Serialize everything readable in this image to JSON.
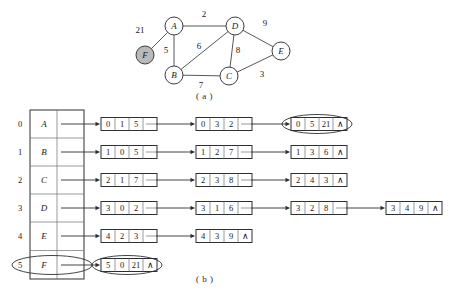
{
  "figure": {
    "caption_a": "( a )",
    "caption_b": "( b )"
  },
  "graph": {
    "nodes": [
      {
        "id": "A",
        "label": "A",
        "x": 174,
        "y": 26,
        "r": 9,
        "highlighted": false
      },
      {
        "id": "D",
        "label": "D",
        "x": 235,
        "y": 26,
        "r": 9,
        "highlighted": false
      },
      {
        "id": "B",
        "label": "B",
        "x": 174,
        "y": 75,
        "r": 9,
        "highlighted": false
      },
      {
        "id": "C",
        "label": "C",
        "x": 229,
        "y": 76,
        "r": 9,
        "highlighted": false
      },
      {
        "id": "E",
        "label": "E",
        "x": 281,
        "y": 51,
        "r": 9,
        "highlighted": false
      },
      {
        "id": "F",
        "label": "F",
        "x": 145,
        "y": 55,
        "r": 9,
        "highlighted": true
      }
    ],
    "edges": [
      {
        "from": "A",
        "to": "D",
        "weight": "2",
        "lx": 204,
        "ly": 17
      },
      {
        "from": "A",
        "to": "B",
        "weight": "5",
        "lx": 166,
        "ly": 53
      },
      {
        "from": "A",
        "to": "F",
        "weight": "21",
        "lx": 140,
        "ly": 33
      },
      {
        "from": "B",
        "to": "D",
        "weight": "6",
        "lx": 199,
        "ly": 49
      },
      {
        "from": "B",
        "to": "C",
        "weight": "7",
        "lx": 201,
        "ly": 88
      },
      {
        "from": "D",
        "to": "C",
        "weight": "8",
        "lx": 238,
        "ly": 53
      },
      {
        "from": "D",
        "to": "E",
        "weight": "9",
        "lx": 265,
        "ly": 26
      },
      {
        "from": "C",
        "to": "E",
        "weight": "3",
        "lx": 262,
        "ly": 77
      }
    ],
    "highlight_color": "#b9b9b9",
    "edge_color": "#55595c"
  },
  "adjacency": {
    "vertex_table": {
      "row_indices": [
        "0",
        "1",
        "2",
        "3",
        "4",
        "5"
      ],
      "vertex_names": [
        "A",
        "B",
        "C",
        "D",
        "E",
        "F"
      ],
      "highlighted_row_index": 5
    },
    "columns": [
      {
        "col": 0,
        "nodes": [
          {
            "row": 0,
            "cells": [
              "0",
              "1",
              "5"
            ],
            "link": "pointer",
            "highlighted": false
          },
          {
            "row": 1,
            "cells": [
              "1",
              "0",
              "5"
            ],
            "link": "pointer",
            "highlighted": false
          },
          {
            "row": 2,
            "cells": [
              "2",
              "1",
              "7"
            ],
            "link": "pointer",
            "highlighted": false
          },
          {
            "row": 3,
            "cells": [
              "3",
              "0",
              "2"
            ],
            "link": "pointer",
            "highlighted": false
          },
          {
            "row": 4,
            "cells": [
              "4",
              "2",
              "3"
            ],
            "link": "pointer",
            "highlighted": false
          },
          {
            "row": 5,
            "cells": [
              "5",
              "0",
              "21"
            ],
            "link": "null",
            "highlighted": true
          }
        ]
      },
      {
        "col": 1,
        "nodes": [
          {
            "row": 0,
            "cells": [
              "0",
              "3",
              "2"
            ],
            "link": "pointer",
            "highlighted": false
          },
          {
            "row": 1,
            "cells": [
              "1",
              "2",
              "7"
            ],
            "link": "pointer",
            "highlighted": false
          },
          {
            "row": 2,
            "cells": [
              "2",
              "3",
              "8"
            ],
            "link": "pointer",
            "highlighted": false
          },
          {
            "row": 3,
            "cells": [
              "3",
              "1",
              "6"
            ],
            "link": "pointer",
            "highlighted": false
          },
          {
            "row": 4,
            "cells": [
              "4",
              "3",
              "9"
            ],
            "link": "null",
            "highlighted": false
          }
        ]
      },
      {
        "col": 2,
        "nodes": [
          {
            "row": 0,
            "cells": [
              "0",
              "5",
              "21"
            ],
            "link": "null",
            "highlighted": true
          },
          {
            "row": 1,
            "cells": [
              "1",
              "3",
              "6"
            ],
            "link": "null",
            "highlighted": false
          },
          {
            "row": 2,
            "cells": [
              "2",
              "4",
              "3"
            ],
            "link": "null",
            "highlighted": false
          },
          {
            "row": 3,
            "cells": [
              "3",
              "2",
              "8"
            ],
            "link": "pointer",
            "highlighted": false
          }
        ]
      },
      {
        "col": 3,
        "nodes": [
          {
            "row": 3,
            "cells": [
              "3",
              "4",
              "9"
            ],
            "link": "null",
            "highlighted": false
          }
        ]
      }
    ],
    "null_symbol": "∧"
  }
}
